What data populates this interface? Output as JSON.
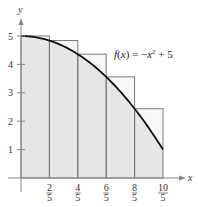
{
  "chart_data": {
    "type": "area",
    "title": "",
    "function_label": "f(x) = −x² + 5",
    "function_label_parts": {
      "f": "f",
      "x": "x",
      "eq": " = −",
      "xvar": "x",
      "exp": "2",
      "tail": " + 5"
    },
    "xlabel": "x",
    "ylabel": "y",
    "xlim": [
      0,
      2.2
    ],
    "ylim": [
      0,
      5.6
    ],
    "x_ticks": [
      {
        "value": 0.4,
        "num": "2",
        "den": "5"
      },
      {
        "value": 0.8,
        "num": "4",
        "den": "5"
      },
      {
        "value": 1.2,
        "num": "6",
        "den": "5"
      },
      {
        "value": 1.6,
        "num": "8",
        "den": "5"
      },
      {
        "value": 2.0,
        "num": "10",
        "den": "5"
      }
    ],
    "y_ticks": [
      {
        "value": 1,
        "label": "1"
      },
      {
        "value": 2,
        "label": "2"
      },
      {
        "value": 3,
        "label": "3"
      },
      {
        "value": 4,
        "label": "4"
      },
      {
        "value": 5,
        "label": "5"
      }
    ],
    "curve": {
      "name": "f(x) = -x^2 + 5",
      "domain": [
        0,
        2
      ],
      "x": [
        0,
        0.2,
        0.4,
        0.6,
        0.8,
        1.0,
        1.2,
        1.4,
        1.6,
        1.8,
        2.0
      ],
      "y": [
        5,
        4.96,
        4.84,
        4.64,
        4.36,
        4.0,
        3.56,
        3.04,
        2.44,
        1.76,
        1.0
      ]
    },
    "rectangles": {
      "type": "upper (left-endpoint) Riemann sum",
      "width": 0.4,
      "left_x": [
        0,
        0.4,
        0.8,
        1.2,
        1.6
      ],
      "heights": [
        5,
        4.84,
        4.36,
        3.56,
        2.44
      ]
    },
    "colors": {
      "shade": "#e6e6e6",
      "rect_stroke": "#7a7a7a",
      "rect_fill": "#f7f7f7",
      "curve": "#111111",
      "axis": "#888888"
    },
    "grid": false,
    "legend": null
  }
}
